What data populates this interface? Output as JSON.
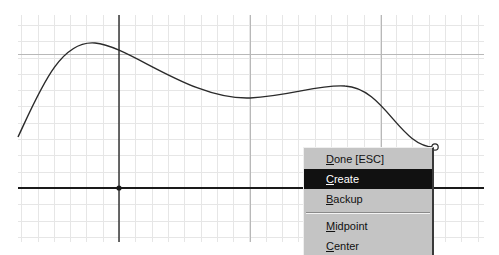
{
  "canvas": {
    "background": "#ffffff",
    "grid": {
      "left": 18,
      "top": 15,
      "right": 484,
      "bottom": 242,
      "cell": 16.3,
      "minor_color": "#e6e6e6",
      "major_color": "#b8b8b8",
      "major_vertical_x": [
        250,
        381
      ],
      "major_horizontal_y": [
        54
      ]
    },
    "axes": {
      "color": "#1a1a1a",
      "x_axis_y": 188,
      "y_axis_x": 119,
      "origin_point": [
        119,
        188
      ]
    },
    "curve": {
      "color": "#2a2a2a",
      "path": "M18,137 C40,90 60,40 95,43 C130,46 190,100 250,98 C290,96 320,84 345,86 C385,88 400,148 435,147",
      "endpoint": [
        435,
        147
      ]
    }
  },
  "context_menu": {
    "items": [
      {
        "underline": "D",
        "rest": "one [ESC]",
        "selected": false
      },
      {
        "underline": "C",
        "rest": "reate",
        "selected": true
      },
      {
        "underline": "B",
        "rest": "ackup",
        "selected": false
      },
      {
        "separator": true
      },
      {
        "underline": "M",
        "rest": "idpoint",
        "selected": false
      },
      {
        "underline": "C",
        "rest": "enter",
        "selected": false,
        "partially_visible": true
      }
    ]
  }
}
